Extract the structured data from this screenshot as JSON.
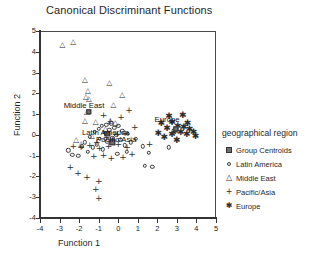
{
  "chart_data": {
    "type": "scatter",
    "title": "Canonical Discriminant Functions",
    "xlabel": "Function 1",
    "ylabel": "Function 2",
    "xlim": [
      -4,
      5
    ],
    "ylim": [
      -4,
      5
    ],
    "xticks": [
      -4,
      -3,
      -2,
      -1,
      0,
      1,
      2,
      3,
      4,
      5
    ],
    "yticks": [
      -4,
      -3,
      -2,
      -1,
      0,
      1,
      2,
      3,
      4,
      5
    ],
    "grid": false,
    "legend_position": "right",
    "legend_title": "geographical region",
    "series": [
      {
        "name": "Latin America",
        "marker": "open-circle",
        "points": [
          [
            -2.55,
            -0.75
          ],
          [
            -2.35,
            -0.95
          ],
          [
            -2.05,
            -1.0
          ],
          [
            -1.85,
            -0.55
          ],
          [
            -1.7,
            -0.35
          ],
          [
            -1.55,
            -0.8
          ],
          [
            -1.45,
            -0.1
          ],
          [
            -1.3,
            -0.6
          ],
          [
            -1.2,
            0.15
          ],
          [
            -1.1,
            -0.45
          ],
          [
            -1.0,
            0.3
          ],
          [
            -0.95,
            -0.2
          ],
          [
            -0.85,
            0.45
          ],
          [
            -0.8,
            -0.7
          ],
          [
            -0.7,
            0.1
          ],
          [
            -0.6,
            0.5
          ],
          [
            -0.55,
            -0.3
          ],
          [
            -0.45,
            0.25
          ],
          [
            -0.35,
            0.55
          ],
          [
            -0.3,
            -0.15
          ],
          [
            -0.2,
            0.35
          ],
          [
            -0.1,
            0.0
          ],
          [
            0.0,
            0.45
          ],
          [
            0.1,
            -0.25
          ],
          [
            0.2,
            0.2
          ],
          [
            0.35,
            -0.5
          ],
          [
            0.5,
            0.05
          ],
          [
            0.65,
            -0.35
          ],
          [
            0.9,
            -0.2
          ],
          [
            1.25,
            -0.55
          ],
          [
            1.55,
            -0.85
          ],
          [
            1.75,
            -1.55
          ],
          [
            1.35,
            -1.5
          ],
          [
            2.6,
            -0.6
          ],
          [
            -0.05,
            -0.9
          ],
          [
            0.45,
            -0.8
          ]
        ]
      },
      {
        "name": "Middle East",
        "marker": "open-triangle",
        "points": [
          [
            -2.85,
            4.35
          ],
          [
            -2.3,
            4.45
          ],
          [
            -1.7,
            2.65
          ],
          [
            -1.55,
            2.1
          ],
          [
            -1.65,
            1.8
          ],
          [
            -1.5,
            1.75
          ],
          [
            -1.6,
            1.1
          ],
          [
            -1.7,
            0.65
          ],
          [
            -0.45,
            2.5
          ],
          [
            0.2,
            1.9
          ],
          [
            -0.25,
            1.45
          ],
          [
            -2.15,
            -0.25
          ],
          [
            -1.9,
            -0.45
          ],
          [
            -1.15,
            0.6
          ],
          [
            -0.65,
            0.3
          ],
          [
            -0.4,
            0.65
          ],
          [
            -0.15,
            0.55
          ],
          [
            -1.35,
            -0.05
          ]
        ]
      },
      {
        "name": "Pacific/Asia",
        "marker": "plus",
        "points": [
          [
            0.55,
            1.2
          ],
          [
            0.15,
            0.85
          ],
          [
            -0.4,
            0.65
          ],
          [
            0.85,
            0.4
          ],
          [
            0.35,
            0.1
          ],
          [
            -0.05,
            0.05
          ],
          [
            -0.6,
            -0.1
          ],
          [
            -1.1,
            -0.35
          ],
          [
            -1.45,
            -0.5
          ],
          [
            -1.9,
            -0.6
          ],
          [
            -2.3,
            -0.55
          ],
          [
            -0.95,
            -0.65
          ],
          [
            -0.5,
            -0.55
          ],
          [
            0.0,
            -0.45
          ],
          [
            0.45,
            -0.6
          ],
          [
            0.7,
            -0.9
          ],
          [
            0.25,
            -1.05
          ],
          [
            -0.35,
            -1.1
          ],
          [
            -0.75,
            -0.95
          ],
          [
            -1.25,
            -1.0
          ],
          [
            -2.05,
            -1.85
          ],
          [
            -1.6,
            -2.05
          ],
          [
            -1.0,
            -2.2
          ],
          [
            -1.15,
            -2.6
          ],
          [
            -2.45,
            -1.55
          ],
          [
            -1.0,
            -3.05
          ],
          [
            1.6,
            -0.45
          ],
          [
            -0.75,
            0.95
          ]
        ]
      },
      {
        "name": "Europe",
        "marker": "asterisk",
        "points": [
          [
            2.2,
            0.55
          ],
          [
            2.5,
            0.35
          ],
          [
            2.75,
            0.6
          ],
          [
            2.9,
            0.2
          ],
          [
            3.05,
            0.45
          ],
          [
            3.2,
            0.15
          ],
          [
            3.35,
            0.4
          ],
          [
            3.5,
            0.05
          ],
          [
            3.65,
            0.3
          ],
          [
            3.85,
            0.15
          ],
          [
            2.6,
            0.9
          ],
          [
            3.3,
            0.95
          ],
          [
            2.35,
            -0.1
          ],
          [
            3.0,
            -0.25
          ],
          [
            2.75,
            0.05
          ],
          [
            3.95,
            -0.05
          ],
          [
            2.05,
            0.1
          ],
          [
            3.55,
            0.55
          ]
        ]
      },
      {
        "name": "Group Centroids",
        "marker": "filled-square",
        "points": [
          [
            -1.5,
            1.1
          ],
          [
            -0.55,
            0.05
          ],
          [
            -0.3,
            -0.35
          ],
          [
            2.95,
            0.3
          ]
        ]
      }
    ],
    "annotations": [
      {
        "text": "Middle East",
        "x": -1.75,
        "y": 1.45
      },
      {
        "text": "Latin America",
        "x": -0.65,
        "y": 0.15
      },
      {
        "text": "Pacific/Asia",
        "x": -0.1,
        "y": -0.2
      },
      {
        "text": "Europe",
        "x": 2.5,
        "y": 0.75
      }
    ]
  },
  "legend": {
    "title": "geographical region",
    "items": [
      {
        "label": "Group Centroids",
        "marker": "filled-square"
      },
      {
        "label": "Latin America",
        "marker": "open-circle"
      },
      {
        "label": "Middle East",
        "marker": "open-triangle"
      },
      {
        "label": "Pacific/Asia",
        "marker": "plus"
      },
      {
        "label": "Europe",
        "marker": "asterisk"
      }
    ]
  }
}
